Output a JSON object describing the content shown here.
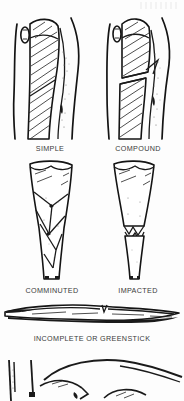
{
  "figure": {
    "style": "black-and-white line drawing",
    "background_color": "#fdfdfd",
    "ink_color": "#1a1a1a",
    "caption_color": "#3a3a3a"
  },
  "panels": [
    {
      "id": "simple",
      "caption": "SIMPLE",
      "row": 1,
      "column": 1,
      "description": "Long bone with oblique fracture line, skin intact",
      "skin_broken": false
    },
    {
      "id": "compound",
      "caption": "COMPOUND",
      "row": 1,
      "column": 2,
      "description": "Fractured bone fragment displaced and protruding through skin",
      "skin_broken": true
    },
    {
      "id": "comminuted",
      "caption": "COMMINUTED",
      "row": 2,
      "column": 1,
      "description": "Bone shattered into multiple fragments",
      "skin_broken": false
    },
    {
      "id": "impacted",
      "caption": "IMPACTED",
      "row": 2,
      "column": 2,
      "description": "Bone ends driven and telescoped into one another",
      "skin_broken": false
    },
    {
      "id": "greenstick",
      "caption": "INCOMPLETE OR GREENSTICK",
      "row": 3,
      "column": 0,
      "description": "Horizontal bone with partial crack through one cortex only",
      "skin_broken": false
    },
    {
      "id": "bottom-partial",
      "caption": "",
      "row": 4,
      "column": 0,
      "description": "Partial illustration cropped at the bottom edge of the page",
      "skin_broken": false
    }
  ]
}
